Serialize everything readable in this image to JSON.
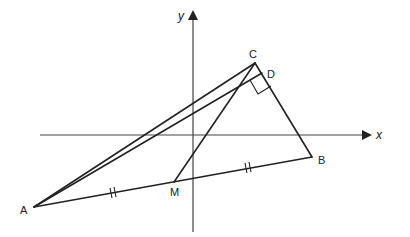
{
  "axes": {
    "x_label": "x",
    "y_label": "y"
  },
  "points": {
    "A": {
      "label": "A",
      "x": 34,
      "y": 207
    },
    "B": {
      "label": "B",
      "x": 312,
      "y": 157
    },
    "C": {
      "label": "C",
      "x": 255,
      "y": 63
    },
    "D": {
      "label": "D",
      "x": 262,
      "y": 73
    },
    "M": {
      "label": "M",
      "x": 174,
      "y": 182
    }
  },
  "segments": [
    "AC",
    "AD",
    "CB",
    "AB",
    "MC"
  ],
  "annotations": {
    "right_angle_at": "D",
    "equal_marks": [
      "AM",
      "MB"
    ]
  }
}
